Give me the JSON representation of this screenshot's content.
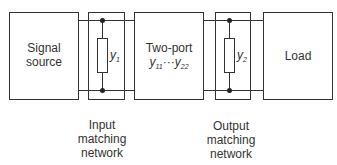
{
  "diagram": {
    "blocks": [
      {
        "id": "signal-source",
        "label_line1": "Signal",
        "label_line2": "source"
      },
      {
        "id": "two-port",
        "label_line1": "Two-port",
        "symbol": "y",
        "sub_a": "11",
        "dots": "···",
        "symbol_b": "y",
        "sub_b": "22"
      },
      {
        "id": "load",
        "label": "Load"
      }
    ],
    "matching_networks": [
      {
        "id": "input",
        "element_symbol": "y",
        "element_sub": "1",
        "caption_line1": "Input",
        "caption_line2": "matching",
        "caption_line3": "network"
      },
      {
        "id": "output",
        "element_symbol": "y",
        "element_sub": "2",
        "caption_line1": "Output",
        "caption_line2": "matching",
        "caption_line3": "network"
      }
    ],
    "colors": {
      "stroke": "#333333",
      "background": "#ffffff"
    }
  }
}
